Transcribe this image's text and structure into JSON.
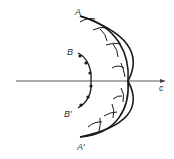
{
  "diagram": {
    "type": "huygens-wavefront",
    "labels": {
      "outer_top": "A",
      "outer_bottom": "A′",
      "inner_top": "B",
      "inner_bottom": "B′",
      "axis": "c"
    },
    "colors": {
      "stroke": "#1a1a1a",
      "axis": "#444444",
      "background": "#ffffff"
    },
    "inner_wavefront_dot_count": 7,
    "wavelet_count": 7
  }
}
